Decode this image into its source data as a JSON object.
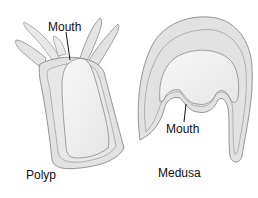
{
  "diagram": {
    "labels": {
      "polyp_mouth": "Mouth",
      "medusa_mouth": "Mouth",
      "polyp": "Polyp",
      "medusa": "Medusa"
    },
    "colors": {
      "body_fill": "#e4e4e4",
      "inner_fill": "#f2f2f2",
      "outline": "#8a8a8a",
      "pointer": "#111111"
    }
  }
}
